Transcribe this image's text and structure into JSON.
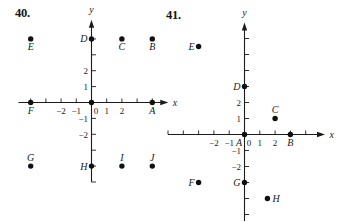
{
  "figures": [
    {
      "number_label": "40."
    },
    {
      "number_label": "41."
    }
  ],
  "chart_data": [
    {
      "type": "scatter",
      "title": "40.",
      "xlabel": "x",
      "ylabel": "y",
      "xlim": [
        -4.8,
        5.05
      ],
      "ylim": [
        -5,
        5.2
      ],
      "grid": false,
      "x_ticks": [
        -4,
        -3,
        -2,
        -1,
        1,
        2,
        3,
        4
      ],
      "y_ticks": [
        -5,
        -4,
        -3,
        -2,
        -1,
        1,
        2,
        3,
        4
      ],
      "x_tick_labels": [
        {
          "value": -2,
          "text": "−2"
        },
        {
          "value": -1,
          "text": "−1"
        },
        {
          "value": 0,
          "text": "0"
        },
        {
          "value": 1,
          "text": "1"
        },
        {
          "value": 2,
          "text": "2"
        }
      ],
      "y_tick_labels": [
        {
          "value": 2,
          "text": "2"
        },
        {
          "value": 1,
          "text": "1"
        },
        {
          "value": -1,
          "text": "−1"
        },
        {
          "value": -2,
          "text": "−2"
        }
      ],
      "points": [
        {
          "label": "A",
          "x": 4,
          "y": 0,
          "label_pos": "below"
        },
        {
          "label": "B",
          "x": 4,
          "y": 4,
          "label_pos": "below"
        },
        {
          "label": "C",
          "x": 2,
          "y": 4,
          "label_pos": "below"
        },
        {
          "label": "D",
          "x": 0,
          "y": 4,
          "label_pos": "left"
        },
        {
          "label": "E",
          "x": -4,
          "y": 4,
          "label_pos": "below"
        },
        {
          "label": "F",
          "x": -4,
          "y": 0,
          "label_pos": "below"
        },
        {
          "label": "G",
          "x": -4,
          "y": -4,
          "label_pos": "above"
        },
        {
          "label": "H",
          "x": 0,
          "y": -4,
          "label_pos": "left"
        },
        {
          "label": "I",
          "x": 2,
          "y": -4,
          "label_pos": "above"
        },
        {
          "label": "J",
          "x": 4,
          "y": -4,
          "label_pos": "above"
        },
        {
          "label": "",
          "x": 0,
          "y": 0,
          "label_pos": "none"
        }
      ]
    },
    {
      "type": "scatter",
      "title": "41.",
      "xlabel": "x",
      "ylabel": "y",
      "xlim": [
        -5,
        5.26
      ],
      "ylim": [
        -5.45,
        7.0
      ],
      "grid": false,
      "x_ticks": [
        -5,
        -4,
        -3,
        -2,
        -1,
        1,
        2,
        3,
        4
      ],
      "y_ticks": [
        -5,
        -4,
        -3,
        -2,
        -1,
        1,
        2,
        3,
        4,
        5,
        6
      ],
      "x_tick_labels": [
        {
          "value": -2,
          "text": "−2"
        },
        {
          "value": -1,
          "text": "−1"
        },
        {
          "value": 0,
          "text": "0"
        },
        {
          "value": 1,
          "text": "1"
        },
        {
          "value": 2,
          "text": "2"
        }
      ],
      "y_tick_labels": [
        {
          "value": 2,
          "text": "2"
        },
        {
          "value": 1,
          "text": "1"
        },
        {
          "value": -1,
          "text": "−1"
        },
        {
          "value": -2,
          "text": "−2"
        }
      ],
      "points": [
        {
          "label": "A",
          "x": 0,
          "y": 0,
          "label_pos": "below-left"
        },
        {
          "label": "B",
          "x": 3,
          "y": 0,
          "label_pos": "below"
        },
        {
          "label": "C",
          "x": 2,
          "y": 1,
          "label_pos": "above"
        },
        {
          "label": "D",
          "x": 0,
          "y": 3,
          "label_pos": "left"
        },
        {
          "label": "E",
          "x": -3,
          "y": 5.5,
          "label_pos": "left"
        },
        {
          "label": "F",
          "x": -3,
          "y": -3,
          "label_pos": "left"
        },
        {
          "label": "G",
          "x": 0,
          "y": -3,
          "label_pos": "left"
        },
        {
          "label": "H",
          "x": 1.5,
          "y": -4,
          "label_pos": "right"
        }
      ]
    }
  ]
}
